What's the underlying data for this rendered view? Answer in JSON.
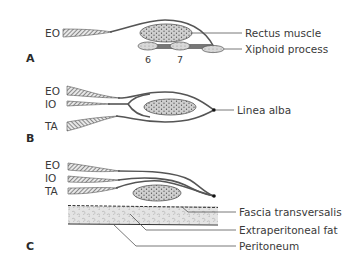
{
  "figure": {
    "panels": [
      {
        "id": "A",
        "label": "A",
        "layers": [
          "EO"
        ],
        "structures": [
          "Rectus muscle",
          "Xiphoid process"
        ],
        "ribs": [
          "6",
          "7"
        ]
      },
      {
        "id": "B",
        "label": "B",
        "layers": [
          "EO",
          "IO",
          "TA"
        ],
        "structures": [
          "Linea alba"
        ]
      },
      {
        "id": "C",
        "label": "C",
        "layers": [
          "EO",
          "IO",
          "TA"
        ],
        "structures": [
          "Fascia transversalis",
          "Extraperitoneal fat",
          "Peritoneum"
        ]
      }
    ]
  },
  "panelA": {
    "label": "A",
    "eo": "EO",
    "rectus": "Rectus muscle",
    "xiphoid": "Xiphoid process",
    "rib6": "6",
    "rib7": "7"
  },
  "panelB": {
    "label": "B",
    "eo": "EO",
    "io": "IO",
    "ta": "TA",
    "linea": "Linea alba"
  },
  "panelC": {
    "label": "C",
    "eo": "EO",
    "io": "IO",
    "ta": "TA",
    "fascia": "Fascia transversalis",
    "fat": "Extraperitoneal fat",
    "peritoneum": "Peritoneum"
  },
  "colors": {
    "line": "#555555",
    "muscle_fill": "#c8c8c8",
    "fat_fill": "#e6e6e6",
    "text": "#3a3a3a"
  }
}
